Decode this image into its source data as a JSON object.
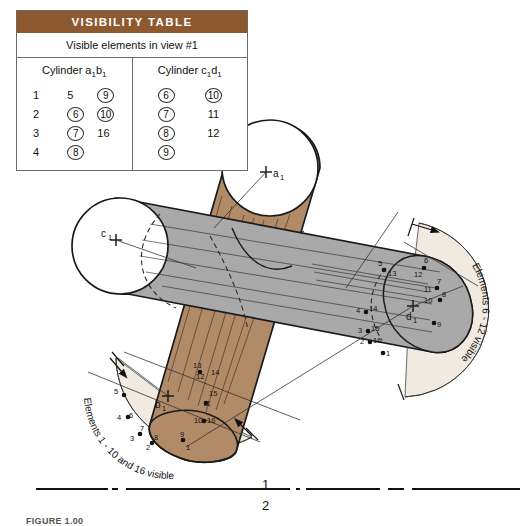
{
  "table": {
    "header": "VISIBILITY TABLE",
    "subtitle": "Visible elements in view #1",
    "columns": [
      {
        "name": "cylinder-ab",
        "title_prefix": "Cylinder a",
        "title_sub1": "1",
        "title_mid": "b",
        "title_sub2": "1",
        "rows": [
          [
            {
              "v": "1",
              "circled": false
            },
            {
              "v": "5",
              "circled": false
            },
            {
              "v": "9",
              "circled": true
            }
          ],
          [
            {
              "v": "2",
              "circled": false
            },
            {
              "v": "6",
              "circled": true
            },
            {
              "v": "10",
              "circled": true
            }
          ],
          [
            {
              "v": "3",
              "circled": false
            },
            {
              "v": "7",
              "circled": true
            },
            {
              "v": "16",
              "circled": false
            }
          ],
          [
            {
              "v": "4",
              "circled": false
            },
            {
              "v": "8",
              "circled": true
            },
            {
              "v": "",
              "circled": false
            }
          ]
        ]
      },
      {
        "name": "cylinder-cd",
        "title_prefix": "Cylinder c",
        "title_sub1": "1",
        "title_mid": "d",
        "title_sub2": "1",
        "rows": [
          [
            {
              "v": "6",
              "circled": true
            },
            {
              "v": "10",
              "circled": true
            }
          ],
          [
            {
              "v": "7",
              "circled": true
            },
            {
              "v": "11",
              "circled": false
            }
          ],
          [
            {
              "v": "8",
              "circled": true
            },
            {
              "v": "12",
              "circled": false
            }
          ],
          [
            {
              "v": "9",
              "circled": true
            },
            {
              "v": "",
              "circled": false
            }
          ]
        ]
      }
    ]
  },
  "drawing": {
    "centers": [
      {
        "name": "a1",
        "label": "a",
        "sub": "1",
        "x": 266,
        "y": 172
      },
      {
        "name": "c1",
        "label": "c",
        "sub": "1",
        "x": 116,
        "y": 237
      },
      {
        "name": "d1",
        "label": "d",
        "sub": "1",
        "x": 413,
        "y": 311
      },
      {
        "name": "b1",
        "label": "b",
        "sub": "1",
        "x": 168,
        "y": 399
      }
    ],
    "arc_notes": [
      {
        "name": "right-arc-note",
        "text": "Elements 6 - 12 visible"
      },
      {
        "name": "left-arc-note",
        "text": "Elements 1 - 10 and 16 visible"
      }
    ],
    "right_points": [
      {
        "n": "5",
        "x": 386,
        "y": 267
      },
      {
        "n": "13",
        "x": 396,
        "y": 273
      },
      {
        "n": "6",
        "x": 428,
        "y": 265
      },
      {
        "n": "12",
        "x": 421,
        "y": 274
      },
      {
        "n": "7",
        "x": 440,
        "y": 286
      },
      {
        "n": "11",
        "x": 428,
        "y": 290
      },
      {
        "n": "8",
        "x": 443,
        "y": 297
      },
      {
        "n": "10",
        "x": 429,
        "y": 300
      },
      {
        "n": "9",
        "x": 438,
        "y": 321
      },
      {
        "n": "5b",
        "x": 389,
        "y": 268
      },
      {
        "n": "4",
        "x": 358,
        "y": 311
      },
      {
        "n": "14",
        "x": 368,
        "y": 310
      },
      {
        "n": "3",
        "x": 360,
        "y": 327
      },
      {
        "n": "15",
        "x": 370,
        "y": 330
      },
      {
        "n": "2",
        "x": 362,
        "y": 339
      },
      {
        "n": "16",
        "x": 372,
        "y": 341
      },
      {
        "n": "1",
        "x": 385,
        "y": 351
      }
    ],
    "left_points": [
      {
        "n": "5",
        "x": 118,
        "y": 396
      },
      {
        "n": "4",
        "x": 120,
        "y": 418
      },
      {
        "n": "6",
        "x": 131,
        "y": 417
      },
      {
        "n": "3",
        "x": 134,
        "y": 439
      },
      {
        "n": "7",
        "x": 141,
        "y": 432
      },
      {
        "n": "2",
        "x": 148,
        "y": 447
      },
      {
        "n": "8",
        "x": 155,
        "y": 438
      },
      {
        "n": "9",
        "x": 183,
        "y": 435
      },
      {
        "n": "1",
        "x": 188,
        "y": 447
      },
      {
        "n": "10",
        "x": 200,
        "y": 420
      },
      {
        "n": "16",
        "x": 211,
        "y": 420
      },
      {
        "n": "11",
        "x": 208,
        "y": 404
      },
      {
        "n": "15",
        "x": 214,
        "y": 394
      },
      {
        "n": "12",
        "x": 202,
        "y": 376
      },
      {
        "n": "14",
        "x": 217,
        "y": 373
      },
      {
        "n": "13",
        "x": 198,
        "y": 366
      }
    ],
    "fold_line": {
      "upper": "1",
      "lower": "2"
    }
  },
  "caption": "FIGURE 1.00",
  "colors": {
    "header_brown": "#8d5a30",
    "cylinder_brown": "#b18a68",
    "cylinder_gray": "#a9a9a9",
    "arc_beige": "#f0eae0",
    "line": "#111111"
  }
}
